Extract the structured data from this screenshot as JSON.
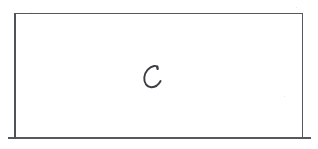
{
  "document": {
    "kind": "scanned-handwriting-sample",
    "background_color": "#ffffff",
    "ink_color": "#3b3d41",
    "rule_color": "#55585c"
  },
  "frame": {
    "label": "bounding-box",
    "x": 14,
    "y": 13,
    "width": 289,
    "height": 124,
    "stroke_color": "#55585c",
    "stroke_width_px": 1.5
  },
  "baseline": {
    "label": "baseline-rule",
    "x": 8,
    "y": 137,
    "width": 303,
    "stroke_color": "#55585c"
  },
  "content": {
    "character": "c",
    "transcription": "c",
    "style": "handwritten-cursive",
    "position": {
      "x": 142,
      "y": 66,
      "width": 20,
      "height": 22
    },
    "ink_color": "#3b3d41"
  }
}
